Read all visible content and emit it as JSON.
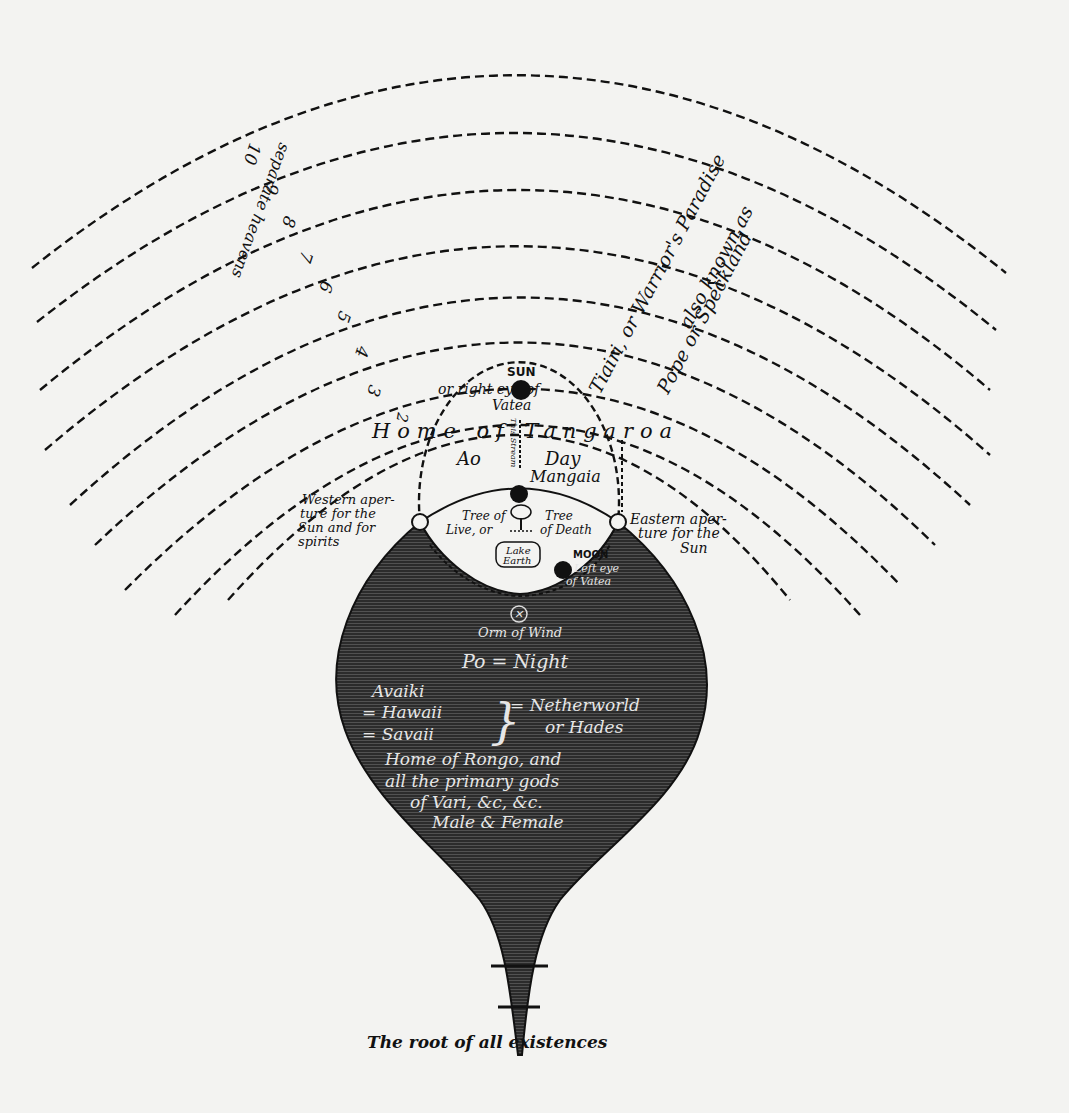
{
  "diagram": {
    "caption": "The root of all existences",
    "colors": {
      "ink": "#111111",
      "paper": "#f3f3f1",
      "shade": "#2a2a2a",
      "shade_text": "#e4e4e4"
    },
    "heavens": {
      "label_numbers": "separate heavens",
      "numbers": [
        "3",
        "4",
        "5",
        "6",
        "7",
        "8",
        "9",
        "10"
      ],
      "paradise_line1": "Tiairi, or Warrior's Paradise",
      "paradise_line2": "also known as",
      "paradise_line3": "Pope or Speckland"
    },
    "upper_world": {
      "sun_label": "SUN",
      "sun_note_1": "or right eye of",
      "sun_note_2": "Vatea",
      "heaven_number": "2",
      "home_label": "Home of Tangaroa",
      "ao_label": "Ao",
      "day_label": "Day",
      "manginia_label": "Mangaia",
      "stream_label": "This Stream",
      "tree_life_1": "Tree of",
      "tree_life_2": "Live, or",
      "tree_death_1": "Tree",
      "tree_death_2": "of Death",
      "lake_label_1": "Lake",
      "lake_label_2": "Earth",
      "moon_label": "MOON",
      "moon_note_1": "Left eye",
      "moon_note_2": "of Vatea"
    },
    "apertures": {
      "western": [
        "Western aper-",
        "ture for the",
        "Sun and for",
        "spirits"
      ],
      "eastern": [
        "Eastern aper-",
        "ture for the",
        "Sun"
      ]
    },
    "netherworld": {
      "wind_label": "Orm of Wind",
      "po_label": "Po = Night",
      "lands": [
        "Avaiki",
        "= Hawaii",
        "= Savaii"
      ],
      "nether_1": "= Netherworld",
      "nether_2": "or Hades",
      "rongo_1": "Home of Rongo, and",
      "rongo_2": "all the primary gods",
      "rongo_3": "of Vari, &c, &c.",
      "rongo_4": "Male & Female"
    }
  }
}
